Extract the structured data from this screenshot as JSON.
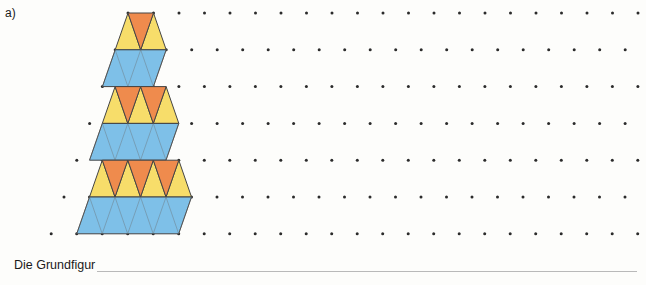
{
  "page": {
    "item_label": "a)",
    "caption": "Die Grundfigur",
    "background_color": "#fdfdfb"
  },
  "dot_grid": {
    "description": "isometric dot lattice",
    "origin_x": 128,
    "origin_y": 13,
    "dx": 25.5,
    "dy": 36.8,
    "rows": 7,
    "cols": 21,
    "dot_color": "#2b2b2b",
    "dot_radius": 1.5
  },
  "figure": {
    "name": "staircase-of-three-triangle-rows",
    "outline_color": "#3a3a3a",
    "colors": {
      "yellow": "#f7dd6a",
      "orange": "#ef8b4e",
      "blue": "#7ec0e8",
      "outline": "#444444"
    },
    "rows": [
      {
        "row_index": 0,
        "label": "top-row",
        "left_col": 0,
        "upper_up_colors": [
          "yellow",
          "yellow"
        ],
        "upper_down_colors": [
          "orange"
        ],
        "lower_band_color": "blue",
        "lower_band_cells": 3
      },
      {
        "row_index": 1,
        "label": "middle-row",
        "left_col": -1,
        "upper_up_colors": [
          "yellow",
          "yellow",
          "yellow"
        ],
        "upper_down_colors": [
          "orange",
          "orange"
        ],
        "lower_band_color": "blue",
        "lower_band_cells": 4
      },
      {
        "row_index": 2,
        "label": "bottom-row",
        "left_col": -2,
        "upper_up_colors": [
          "yellow",
          "yellow",
          "yellow",
          "yellow"
        ],
        "upper_down_colors": [
          "orange",
          "orange",
          "orange"
        ],
        "lower_band_color": "blue",
        "lower_band_cells": 5
      }
    ]
  }
}
